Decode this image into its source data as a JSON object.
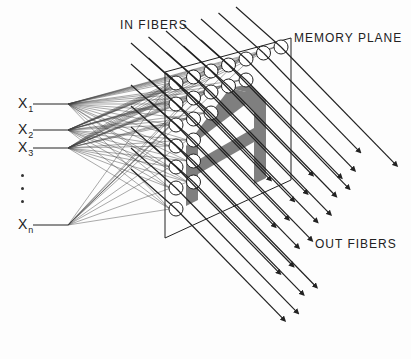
{
  "diagram": {
    "labels": {
      "in_fibers": "IN FIBERS",
      "memory_plane": "MEMORY PLANE",
      "out_fibers": "OUT FIBERS"
    },
    "inputs": [
      {
        "base": "X",
        "sub": "1"
      },
      {
        "base": "X",
        "sub": "2"
      },
      {
        "base": "X",
        "sub": "3"
      },
      {
        "base": "X",
        "sub": "n"
      }
    ],
    "ellipsis": "• • •",
    "stored_pattern": "A",
    "colors": {
      "line": "#222222",
      "pattern_shadow": "#555555",
      "background": "#fdfdfd"
    }
  }
}
